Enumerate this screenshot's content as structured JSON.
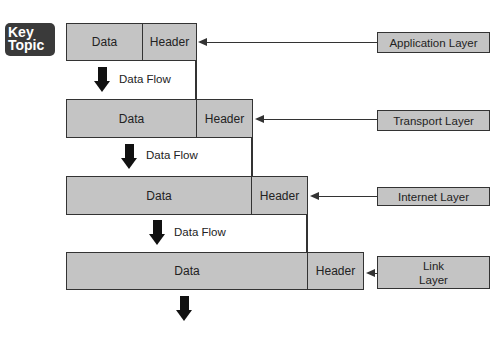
{
  "badge": {
    "line1": "Key",
    "line2": "Topic"
  },
  "pdus": [
    {
      "data_label": "Data",
      "header_label": "Header"
    },
    {
      "data_label": "Data",
      "header_label": "Header"
    },
    {
      "data_label": "Data",
      "header_label": "Header"
    },
    {
      "data_label": "Data",
      "header_label": "Header"
    }
  ],
  "flows": [
    {
      "label": "Data Flow"
    },
    {
      "label": "Data Flow"
    },
    {
      "label": "Data Flow"
    }
  ],
  "layers": [
    {
      "line1": "Application Layer",
      "line2": ""
    },
    {
      "line1": "Transport Layer",
      "line2": ""
    },
    {
      "line1": "Internet Layer",
      "line2": ""
    },
    {
      "line1": "Link",
      "line2": "Layer"
    }
  ],
  "colors": {
    "box_fill": "#c4c4c4",
    "stroke": "#333333",
    "badge_bg": "#3a3a3a"
  }
}
